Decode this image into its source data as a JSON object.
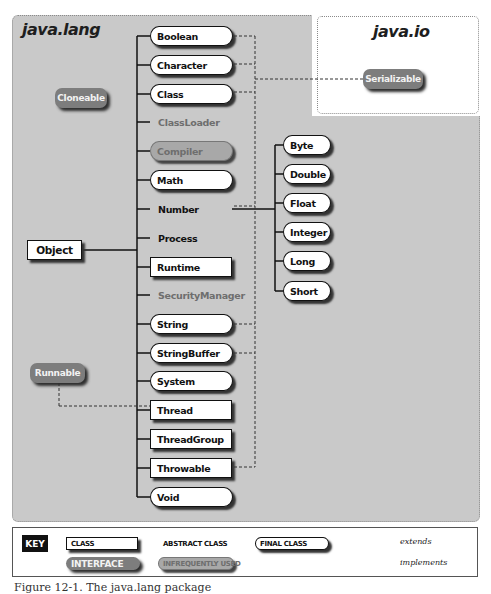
{
  "packages": {
    "lang": {
      "title": "java.lang"
    },
    "io": {
      "title": "java.io"
    }
  },
  "root": {
    "label": "Object",
    "kind": "class"
  },
  "interfaces": {
    "cloneable": {
      "label": "Cloneable"
    },
    "runnable": {
      "label": "Runnable"
    },
    "serializable": {
      "label": "Serializable"
    }
  },
  "classes": [
    {
      "label": "Boolean",
      "kind": "final",
      "implements": "Serializable"
    },
    {
      "label": "Character",
      "kind": "final",
      "implements": "Serializable"
    },
    {
      "label": "Class",
      "kind": "final",
      "implements": "Serializable"
    },
    {
      "label": "ClassLoader",
      "kind": "abstract-infrequent"
    },
    {
      "label": "Compiler",
      "kind": "final-infrequent"
    },
    {
      "label": "Math",
      "kind": "final"
    },
    {
      "label": "Number",
      "kind": "abstract",
      "implements": "Serializable"
    },
    {
      "label": "Process",
      "kind": "abstract"
    },
    {
      "label": "Runtime",
      "kind": "class"
    },
    {
      "label": "SecurityManager",
      "kind": "abstract-infrequent"
    },
    {
      "label": "String",
      "kind": "final",
      "implements": "Serializable"
    },
    {
      "label": "StringBuffer",
      "kind": "final",
      "implements": "Serializable"
    },
    {
      "label": "System",
      "kind": "final"
    },
    {
      "label": "Thread",
      "kind": "class",
      "implements": "Runnable"
    },
    {
      "label": "ThreadGroup",
      "kind": "class"
    },
    {
      "label": "Throwable",
      "kind": "class",
      "implements": "Serializable"
    },
    {
      "label": "Void",
      "kind": "final"
    }
  ],
  "number_subclasses": [
    {
      "label": "Byte",
      "kind": "final"
    },
    {
      "label": "Double",
      "kind": "final"
    },
    {
      "label": "Float",
      "kind": "final"
    },
    {
      "label": "Integer",
      "kind": "final"
    },
    {
      "label": "Long",
      "kind": "final"
    },
    {
      "label": "Short",
      "kind": "final"
    }
  ],
  "key": {
    "title": "KEY",
    "class": "CLASS",
    "abstract_class": "ABSTRACT CLASS",
    "final_class": "FINAL CLASS",
    "interface": "INTERFACE",
    "infrequently_used": "INFREQUENTLY USED",
    "extends": "extends",
    "implements": "implements"
  },
  "caption": "Figure 12-1. The java.lang package",
  "colors": {
    "panel_bg": "#c9c9c9",
    "interface_bg": "#7d7d7d",
    "infrequent_bg": "#a8a8a8",
    "class_bg": "#ffffff",
    "line": "#111111"
  }
}
